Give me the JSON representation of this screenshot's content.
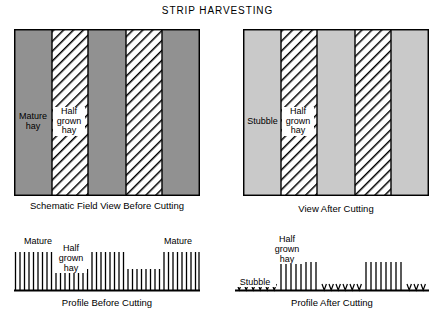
{
  "figure": {
    "title": "STRIP HARVESTING",
    "background_color": "#ffffff",
    "ink_color": "#000000"
  },
  "colors": {
    "mature_hay_fill": "#919191",
    "stubble_fill": "#c9c9c9",
    "hatch_background": "#ffffff",
    "hatch_line": "#000000",
    "border": "#000000"
  },
  "panels": {
    "before_field": {
      "caption": "Schematic Field View Before Cutting",
      "labels": {
        "mature": "Mature\nhay",
        "mature_line1": "Mature",
        "mature_line2": "hay",
        "half_grown_line1": "Half",
        "half_grown_line2": "grown",
        "half_grown_line3": "hay"
      },
      "strips": [
        {
          "type": "mature-hay",
          "label": "Mature hay"
        },
        {
          "type": "half-grown-hay",
          "label": "Half grown hay"
        },
        {
          "type": "mature-hay",
          "label": "Mature hay"
        },
        {
          "type": "half-grown-hay",
          "label": "Half grown hay"
        },
        {
          "type": "mature-hay",
          "label": "Mature hay"
        }
      ]
    },
    "after_field": {
      "caption": "View After Cutting",
      "labels": {
        "stubble": "Stubble",
        "half_grown_line1": "Half",
        "half_grown_line2": "grown",
        "half_grown_line3": "hay"
      },
      "strips": [
        {
          "type": "stubble",
          "label": "Stubble"
        },
        {
          "type": "half-grown-hay",
          "label": "Half grown hay"
        },
        {
          "type": "stubble",
          "label": "Stubble"
        },
        {
          "type": "half-grown-hay",
          "label": "Half grown hay"
        },
        {
          "type": "stubble",
          "label": "Stubble"
        }
      ]
    },
    "before_profile": {
      "caption": "Profile Before Cutting",
      "labels": {
        "mature_left": "Mature",
        "half_grown_line1": "Half",
        "half_grown_line2": "grown",
        "half_grown_line3": "hay",
        "mature_right": "Mature"
      },
      "bands": [
        {
          "type": "mature-hay",
          "height": "tall"
        },
        {
          "type": "half-grown-hay",
          "height": "short"
        },
        {
          "type": "mature-hay",
          "height": "tall"
        },
        {
          "type": "half-grown-hay",
          "height": "short"
        },
        {
          "type": "mature-hay",
          "height": "tall"
        }
      ]
    },
    "after_profile": {
      "caption": "Profile After Cutting",
      "labels": {
        "stubble": "Stubble",
        "half_grown_line1": "Half",
        "half_grown_line2": "grown",
        "half_grown_line3": "hay"
      },
      "bands": [
        {
          "type": "stubble",
          "height": "stubble"
        },
        {
          "type": "half-grown-hay",
          "height": "medium"
        },
        {
          "type": "stubble",
          "height": "stubble"
        },
        {
          "type": "half-grown-hay",
          "height": "medium"
        },
        {
          "type": "stubble",
          "height": "stubble"
        }
      ]
    }
  }
}
